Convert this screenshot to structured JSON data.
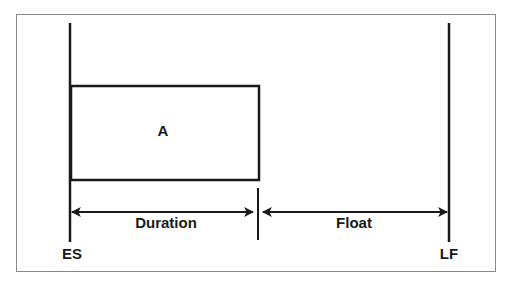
{
  "diagram": {
    "activity_label": "A",
    "duration_label": "Duration",
    "float_label": "Float",
    "early_start_label": "ES",
    "late_finish_label": "LF",
    "colors": {
      "line": "#1a1a1a",
      "frame": "#8a8a8a",
      "background": "#ffffff"
    }
  }
}
